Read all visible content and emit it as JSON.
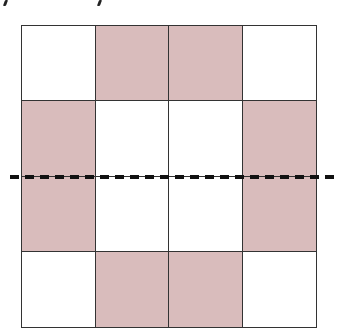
{
  "diagram": {
    "type": "grid-with-fold-line",
    "rows": 4,
    "cols": 4,
    "colors": {
      "shaded": "#d9bcbc",
      "unshaded": "#ffffff",
      "grid_line": "#333333",
      "dashed_line": "#111111"
    },
    "cells": [
      [
        "unshaded",
        "shaded",
        "shaded",
        "unshaded"
      ],
      [
        "shaded",
        "unshaded",
        "unshaded",
        "shaded"
      ],
      [
        "shaded",
        "unshaded",
        "unshaded",
        "shaded"
      ],
      [
        "unshaded",
        "shaded",
        "shaded",
        "unshaded"
      ]
    ],
    "fold_line": {
      "orientation": "horizontal",
      "style": "dashed",
      "position": "middle"
    },
    "top_fragments": [
      "text-fragment",
      "text-fragment"
    ]
  }
}
